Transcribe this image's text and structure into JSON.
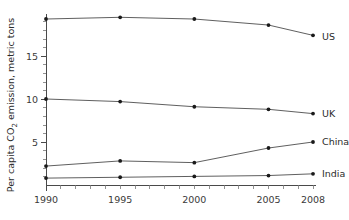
{
  "chart_data": {
    "type": "line",
    "title": "",
    "subtitle": "",
    "xlabel": "",
    "ylabel": "Per capita CO2 emission, metric tons",
    "ylabel_parts": {
      "pre": "Per capita CO",
      "sub": "2",
      "post": " emission, metric tons"
    },
    "x": [
      1990,
      1995,
      2000,
      2005,
      2008
    ],
    "xtick_labels": [
      "1990",
      "1995",
      "2000",
      "2005",
      "2008"
    ],
    "ytick_labels": [
      "5",
      "10",
      "15"
    ],
    "yticks": [
      5,
      10,
      15
    ],
    "xlim": [
      1990,
      2008
    ],
    "ylim": [
      0,
      20
    ],
    "grid": false,
    "legend_position": "right-inline",
    "marker": "filled-circle",
    "line_color": "#4d4d4d",
    "marker_color": "#1a1a1a",
    "axis_color": "#4a4a4a",
    "series": [
      {
        "name": "US",
        "label": "US",
        "values": [
          19.3,
          19.5,
          19.3,
          18.6,
          17.4
        ]
      },
      {
        "name": "UK",
        "label": "UK",
        "values": [
          10.0,
          9.7,
          9.1,
          8.8,
          8.3
        ]
      },
      {
        "name": "China",
        "label": "China",
        "values": [
          2.2,
          2.8,
          2.6,
          4.3,
          5.0
        ]
      },
      {
        "name": "India",
        "label": "India",
        "values": [
          0.8,
          0.9,
          1.0,
          1.1,
          1.3
        ]
      }
    ]
  }
}
